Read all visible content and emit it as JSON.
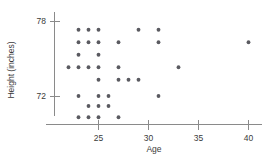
{
  "chart_data": {
    "type": "scatter",
    "title": "",
    "xlabel": "Age",
    "ylabel": "Height (inches)",
    "xlim": [
      21,
      41.5
    ],
    "ylim": [
      69.6,
      78.8
    ],
    "grid": false,
    "legend": null,
    "x_ticks": [
      25,
      30,
      35,
      40
    ],
    "x_tick_labels": [
      "25",
      "30",
      "35",
      "40"
    ],
    "y_ticks": [
      72,
      78
    ],
    "y_tick_labels": [
      "72",
      "78"
    ],
    "marker_color": "#5a5a60",
    "axis_color": "#8a8a8a",
    "points": [
      {
        "x": 23,
        "y": 77.3
      },
      {
        "x": 24,
        "y": 77.3
      },
      {
        "x": 25,
        "y": 77.3
      },
      {
        "x": 29,
        "y": 77.3
      },
      {
        "x": 31,
        "y": 77.3
      },
      {
        "x": 23,
        "y": 76.3
      },
      {
        "x": 24,
        "y": 76.3
      },
      {
        "x": 25,
        "y": 76.3
      },
      {
        "x": 27,
        "y": 76.3
      },
      {
        "x": 31,
        "y": 76.3
      },
      {
        "x": 40,
        "y": 76.3
      },
      {
        "x": 23,
        "y": 75.3
      },
      {
        "x": 25,
        "y": 75.3
      },
      {
        "x": 22,
        "y": 74.3
      },
      {
        "x": 23,
        "y": 74.3
      },
      {
        "x": 24,
        "y": 74.3
      },
      {
        "x": 25,
        "y": 74.3
      },
      {
        "x": 27,
        "y": 74.3
      },
      {
        "x": 33,
        "y": 74.3
      },
      {
        "x": 25,
        "y": 73.3
      },
      {
        "x": 27,
        "y": 73.3
      },
      {
        "x": 28,
        "y": 73.3
      },
      {
        "x": 29,
        "y": 73.3
      },
      {
        "x": 23,
        "y": 72.0
      },
      {
        "x": 25,
        "y": 72.0
      },
      {
        "x": 26,
        "y": 72.0
      },
      {
        "x": 31,
        "y": 72.0
      },
      {
        "x": 24,
        "y": 71.2
      },
      {
        "x": 25,
        "y": 71.2
      },
      {
        "x": 26,
        "y": 71.2
      },
      {
        "x": 23,
        "y": 70.3
      },
      {
        "x": 24,
        "y": 70.3
      },
      {
        "x": 25,
        "y": 70.3
      },
      {
        "x": 27,
        "y": 70.3
      }
    ]
  }
}
